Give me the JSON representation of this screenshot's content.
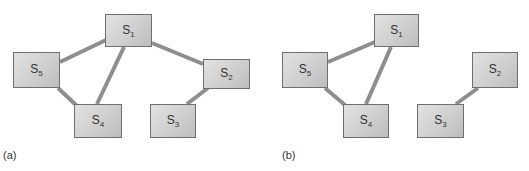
{
  "figure": {
    "edge_color": "#8e8e8e",
    "node_fill": "#d2d2d2",
    "panels": [
      {
        "label": "(a)",
        "nodes": [
          {
            "id": "S1",
            "base": "S",
            "sub": "1",
            "x": 105,
            "y": 14,
            "w": 47,
            "h": 33
          },
          {
            "id": "S5",
            "base": "S",
            "sub": "5",
            "x": 13,
            "y": 52,
            "w": 47,
            "h": 36
          },
          {
            "id": "S2",
            "base": "S",
            "sub": "2",
            "x": 203,
            "y": 59,
            "w": 47,
            "h": 30
          },
          {
            "id": "S4",
            "base": "S",
            "sub": "4",
            "x": 74,
            "y": 104,
            "w": 48,
            "h": 34
          },
          {
            "id": "S3",
            "base": "S",
            "sub": "3",
            "x": 150,
            "y": 104,
            "w": 46,
            "h": 34
          }
        ],
        "edges": [
          [
            "S1",
            "S5"
          ],
          [
            "S1",
            "S4"
          ],
          [
            "S1",
            "S2"
          ],
          [
            "S5",
            "S4"
          ],
          [
            "S2",
            "S3"
          ]
        ]
      },
      {
        "label": "(b)",
        "nodes": [
          {
            "id": "S1",
            "base": "S",
            "sub": "1",
            "x": 374,
            "y": 14,
            "w": 45,
            "h": 33
          },
          {
            "id": "S5",
            "base": "S",
            "sub": "5",
            "x": 282,
            "y": 52,
            "w": 46,
            "h": 36
          },
          {
            "id": "S2",
            "base": "S",
            "sub": "2",
            "x": 472,
            "y": 52,
            "w": 46,
            "h": 36
          },
          {
            "id": "S4",
            "base": "S",
            "sub": "4",
            "x": 343,
            "y": 104,
            "w": 46,
            "h": 34
          },
          {
            "id": "S3",
            "base": "S",
            "sub": "3",
            "x": 417,
            "y": 104,
            "w": 47,
            "h": 34
          }
        ],
        "edges": [
          [
            "S1",
            "S5"
          ],
          [
            "S1",
            "S4"
          ],
          [
            "S5",
            "S4"
          ],
          [
            "S2",
            "S3"
          ]
        ]
      }
    ]
  },
  "labels": {
    "panel_a": "(a)",
    "panel_b": "(b)",
    "a": {
      "S1": "S",
      "S1_sub": "1",
      "S2": "S",
      "S2_sub": "2",
      "S3": "S",
      "S3_sub": "3",
      "S4": "S",
      "S4_sub": "4",
      "S5": "S",
      "S5_sub": "5"
    },
    "b": {
      "S1": "S",
      "S1_sub": "1",
      "S2": "S",
      "S2_sub": "2",
      "S3": "S",
      "S3_sub": "3",
      "S4": "S",
      "S4_sub": "4",
      "S5": "S",
      "S5_sub": "5"
    }
  }
}
